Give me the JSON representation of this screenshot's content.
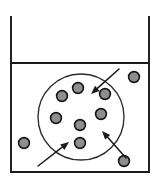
{
  "figure": {
    "canvas": {
      "width": 161,
      "height": 187
    },
    "background_color": "#ffffff"
  },
  "colors": {
    "outline": "#1a1a1a",
    "region_outline": "#2b2b2b",
    "particle_fill": "#8e8e8e",
    "particle_stroke": "#151515",
    "arrow": "#1a1a1a",
    "background": "#ffffff"
  },
  "container": {
    "name": "open-top vessel",
    "left_x": 11,
    "right_x": 149,
    "top_y": 17,
    "bottom_y": 172,
    "stroke_width": 1.9,
    "wall_path": "M 11 17 L 11 172 L 149 172 L 149 17",
    "open_top": true
  },
  "level_line": {
    "name": "surface level line",
    "y": 63,
    "x_start": 11,
    "x_end": 149,
    "stroke_width": 1.9
  },
  "region": {
    "name": "circular region",
    "center_x": 81,
    "center_y": 117,
    "radius": 43,
    "stroke_width": 1.35
  },
  "particles": [
    {
      "id": "p1",
      "label": "inside-upper-left",
      "cx": 62,
      "cy": 96,
      "r": 5.4,
      "inside_region": true
    },
    {
      "id": "p2",
      "label": "inside-top",
      "cx": 78,
      "cy": 88,
      "r": 5.4,
      "inside_region": true
    },
    {
      "id": "p3",
      "label": "inside-upper-right",
      "cx": 105,
      "cy": 94,
      "r": 5.4,
      "inside_region": true
    },
    {
      "id": "p4",
      "label": "inside-left",
      "cx": 56,
      "cy": 118,
      "r": 5.4,
      "inside_region": true
    },
    {
      "id": "p5",
      "label": "inside-right",
      "cx": 101,
      "cy": 114,
      "r": 5.4,
      "inside_region": true
    },
    {
      "id": "p6",
      "label": "inside-center",
      "cx": 80,
      "cy": 125,
      "r": 5.4,
      "inside_region": true
    },
    {
      "id": "p7",
      "label": "inside-bottom",
      "cx": 80,
      "cy": 143,
      "r": 5.4,
      "inside_region": true
    },
    {
      "id": "p8",
      "label": "outside-left",
      "cx": 24,
      "cy": 143,
      "r": 5.4,
      "inside_region": false
    },
    {
      "id": "p9",
      "label": "outside-top-right",
      "cx": 134,
      "cy": 77,
      "r": 5.4,
      "inside_region": false
    },
    {
      "id": "p10",
      "label": "outside-bottom-right",
      "cx": 124,
      "cy": 161,
      "r": 5.4,
      "inside_region": false
    }
  ],
  "arrows": [
    {
      "id": "a1",
      "label": "arrow-from-upper-right",
      "x1": 119,
      "y1": 69,
      "x2": 91,
      "y2": 94,
      "direction": "inward",
      "head_angle_deg": 138
    },
    {
      "id": "a2",
      "label": "arrow-from-lower-left",
      "x1": 38,
      "y1": 166,
      "x2": 69,
      "y2": 142,
      "direction": "inward",
      "head_angle_deg": -38
    },
    {
      "id": "a3",
      "label": "arrow-from-lower-right",
      "x1": 126,
      "y1": 158,
      "x2": 102,
      "y2": 131,
      "direction": "inward",
      "head_angle_deg": -132
    }
  ],
  "counts": {
    "particles_total": 10,
    "particles_inside_region": 7,
    "particles_outside_region": 3,
    "arrows": 3
  }
}
